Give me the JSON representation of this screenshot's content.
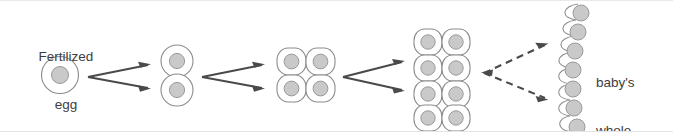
{
  "figure": {
    "background_color": "#ffffff",
    "width": 673,
    "height": 132
  },
  "labels": {
    "fertilized_egg": "Fertilized\negg",
    "fertilized_egg_line1": "Fertilized",
    "fertilized_egg_line2": "egg",
    "baby_whole_body": "baby's\nwhole\nbody",
    "baby_whole_body_line1": "baby's",
    "baby_whole_body_line2": "whole",
    "baby_whole_body_line3": "body"
  },
  "colors": {
    "membrane_stroke": "#8c8c8c",
    "nucleus_fill": "#c9c9c9",
    "nucleus_stroke": "#9a9a9a",
    "arrow": "#4a4a4a",
    "text": "#3d3d3d",
    "background": "#ffffff"
  },
  "stages": [
    {
      "id": "stage-1-cell",
      "name": "fertilized-egg",
      "cell_count": 1,
      "layout": "single",
      "columns": 1,
      "rows": 1,
      "label": "Fertilized egg"
    },
    {
      "id": "stage-2-cell",
      "name": "two-cell-stage",
      "cell_count": 2,
      "layout": "column",
      "columns": 1,
      "rows": 2,
      "label": ""
    },
    {
      "id": "stage-4-cell",
      "name": "four-cell-stage",
      "cell_count": 4,
      "layout": "grid",
      "columns": 2,
      "rows": 2,
      "label": ""
    },
    {
      "id": "stage-8-cell",
      "name": "eight-cell-stage",
      "cell_count": 8,
      "layout": "grid",
      "columns": 2,
      "rows": 4,
      "label": ""
    },
    {
      "id": "stage-many-cell",
      "name": "many-cell-body",
      "cell_count": 7,
      "layout": "wavy-column",
      "columns": 1,
      "rows": 7,
      "label": "baby's whole body"
    }
  ],
  "arrows": [
    {
      "id": "arrow-group-1",
      "name": "division-arrow-1-to-2",
      "style": "solid",
      "direction": "right",
      "branches": 2,
      "from_stage": "stage-1-cell",
      "to_stage": "stage-2-cell"
    },
    {
      "id": "arrow-group-2",
      "name": "division-arrow-2-to-4",
      "style": "solid",
      "direction": "right",
      "branches": 2,
      "from_stage": "stage-2-cell",
      "to_stage": "stage-4-cell"
    },
    {
      "id": "arrow-group-3",
      "name": "division-arrow-4-to-8",
      "style": "solid",
      "direction": "right",
      "branches": 2,
      "from_stage": "stage-4-cell",
      "to_stage": "stage-8-cell"
    },
    {
      "id": "arrow-group-4",
      "name": "division-arrow-8-to-many",
      "style": "dashed",
      "direction": "bidirectional",
      "branches": 2,
      "from_stage": "stage-8-cell",
      "to_stage": "stage-many-cell"
    }
  ],
  "icons": {
    "cell": "cell-icon",
    "nucleus": "nucleus-icon",
    "arrow_right": "arrow-right-icon",
    "arrow_left": "arrow-left-icon"
  }
}
